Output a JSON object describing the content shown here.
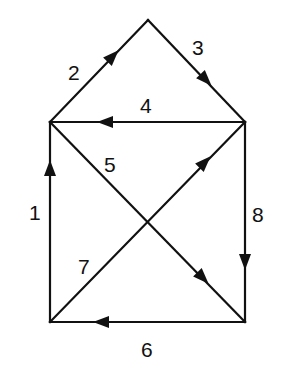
{
  "diagram": {
    "type": "directed-graph",
    "vertices": [
      {
        "id": "top",
        "x": 148,
        "y": 20
      },
      {
        "id": "upper-left",
        "x": 50,
        "y": 122
      },
      {
        "id": "upper-right",
        "x": 245,
        "y": 122
      },
      {
        "id": "lower-left",
        "x": 50,
        "y": 322
      },
      {
        "id": "lower-right",
        "x": 245,
        "y": 322
      }
    ],
    "edges": [
      {
        "label": "1",
        "from": "lower-left",
        "to": "upper-left"
      },
      {
        "label": "2",
        "from": "upper-left",
        "to": "top"
      },
      {
        "label": "3",
        "from": "top",
        "to": "upper-right"
      },
      {
        "label": "4",
        "from": "upper-right",
        "to": "upper-left"
      },
      {
        "label": "5",
        "from": "upper-left",
        "to": "lower-right"
      },
      {
        "label": "6",
        "from": "lower-right",
        "to": "lower-left"
      },
      {
        "label": "7",
        "from": "lower-left",
        "to": "upper-right"
      },
      {
        "label": "8",
        "from": "upper-right",
        "to": "lower-right"
      }
    ],
    "labels": {
      "e1": "1",
      "e2": "2",
      "e3": "3",
      "e4": "4",
      "e5": "5",
      "e6": "6",
      "e7": "7",
      "e8": "8"
    },
    "colors": {
      "stroke": "#111111",
      "background": "#ffffff"
    }
  }
}
